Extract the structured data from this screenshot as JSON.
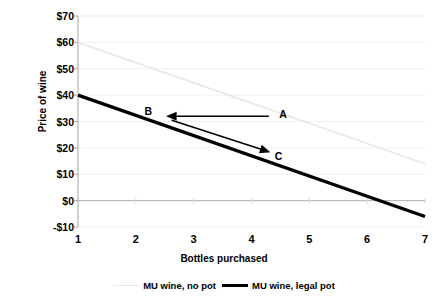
{
  "chart_data": {
    "type": "line",
    "title": "",
    "xlabel": "Bottles purchased",
    "ylabel": "Price of wine",
    "xlim": [
      1,
      7
    ],
    "ylim": [
      -10,
      70
    ],
    "x_ticks": [
      "1",
      "2",
      "3",
      "4",
      "5",
      "6",
      "7"
    ],
    "y_ticks": [
      "$70",
      "$60",
      "$50",
      "$40",
      "$30",
      "$20",
      "$10",
      "$0",
      "-$10"
    ],
    "y_tick_values": [
      70,
      60,
      50,
      40,
      30,
      20,
      10,
      0,
      -10
    ],
    "grid": true,
    "legend_position": "bottom",
    "series": [
      {
        "name": "MU wine, no pot",
        "color": "#e8e8e8",
        "width": 1.6,
        "x": [
          1,
          7
        ],
        "values": [
          60,
          14
        ]
      },
      {
        "name": "MU wine, legal pot",
        "color": "#000000",
        "width": 3.2,
        "x": [
          1,
          7
        ],
        "values": [
          40,
          -6
        ]
      }
    ],
    "annotations": [
      {
        "label": "A",
        "x": 4.55,
        "y": 33
      },
      {
        "label": "B",
        "x": 2.22,
        "y": 34
      },
      {
        "label": "C",
        "x": 4.47,
        "y": 17
      }
    ],
    "arrows": [
      {
        "name": "arrow-a-to-b",
        "x1": 4.3,
        "y1": 32,
        "x2": 2.55,
        "y2": 32
      },
      {
        "name": "arrow-b-to-c",
        "x1": 2.62,
        "y1": 30.5,
        "x2": 4.3,
        "y2": 18.5
      }
    ]
  },
  "legend": {
    "items": [
      {
        "label": "MU wine, no pot"
      },
      {
        "label": "MU wine, legal pot"
      }
    ]
  },
  "axes": {
    "y_title": "Price of wine",
    "x_title": "Bottles purchased"
  }
}
